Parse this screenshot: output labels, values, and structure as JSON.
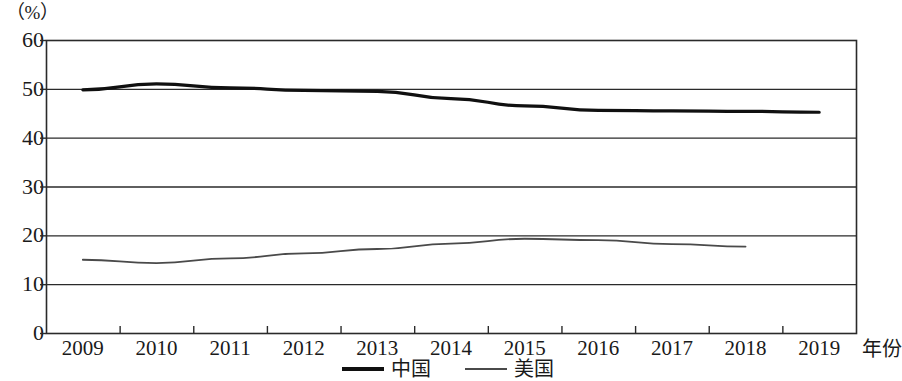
{
  "chart_data": {
    "type": "line",
    "title": "",
    "unit_label": "（%）",
    "xlabel": "年份",
    "ylabel": "",
    "categories": [
      "2009",
      "2010",
      "2011",
      "2012",
      "2013",
      "2014",
      "2015",
      "2016",
      "2017",
      "2018",
      "2019"
    ],
    "x": [
      2009,
      2010,
      2011,
      2012,
      2013,
      2014,
      2015,
      2016,
      2017,
      2018,
      2019
    ],
    "yticks": [
      "0",
      "10",
      "20",
      "30",
      "40",
      "50",
      "60"
    ],
    "ytick_values": [
      0,
      10,
      20,
      30,
      40,
      50,
      60
    ],
    "ylim": [
      0,
      60
    ],
    "grid": true,
    "legend_position": "bottom-center",
    "series": [
      {
        "name": "中国",
        "color": "#101010",
        "width": 3.2,
        "values": [
          49.8,
          51.0,
          50.2,
          49.7,
          49.5,
          48.0,
          46.5,
          45.6,
          45.5,
          45.4,
          45.2
        ]
      },
      {
        "name": "美国",
        "color": "#4a4a4a",
        "width": 1.8,
        "values": [
          15.0,
          14.3,
          15.3,
          16.3,
          17.2,
          18.3,
          19.3,
          19.0,
          18.2,
          17.7,
          null
        ]
      }
    ]
  },
  "legend": {
    "items": [
      {
        "label": "中国",
        "style": "thick"
      },
      {
        "label": "美国",
        "style": "thin"
      }
    ]
  }
}
